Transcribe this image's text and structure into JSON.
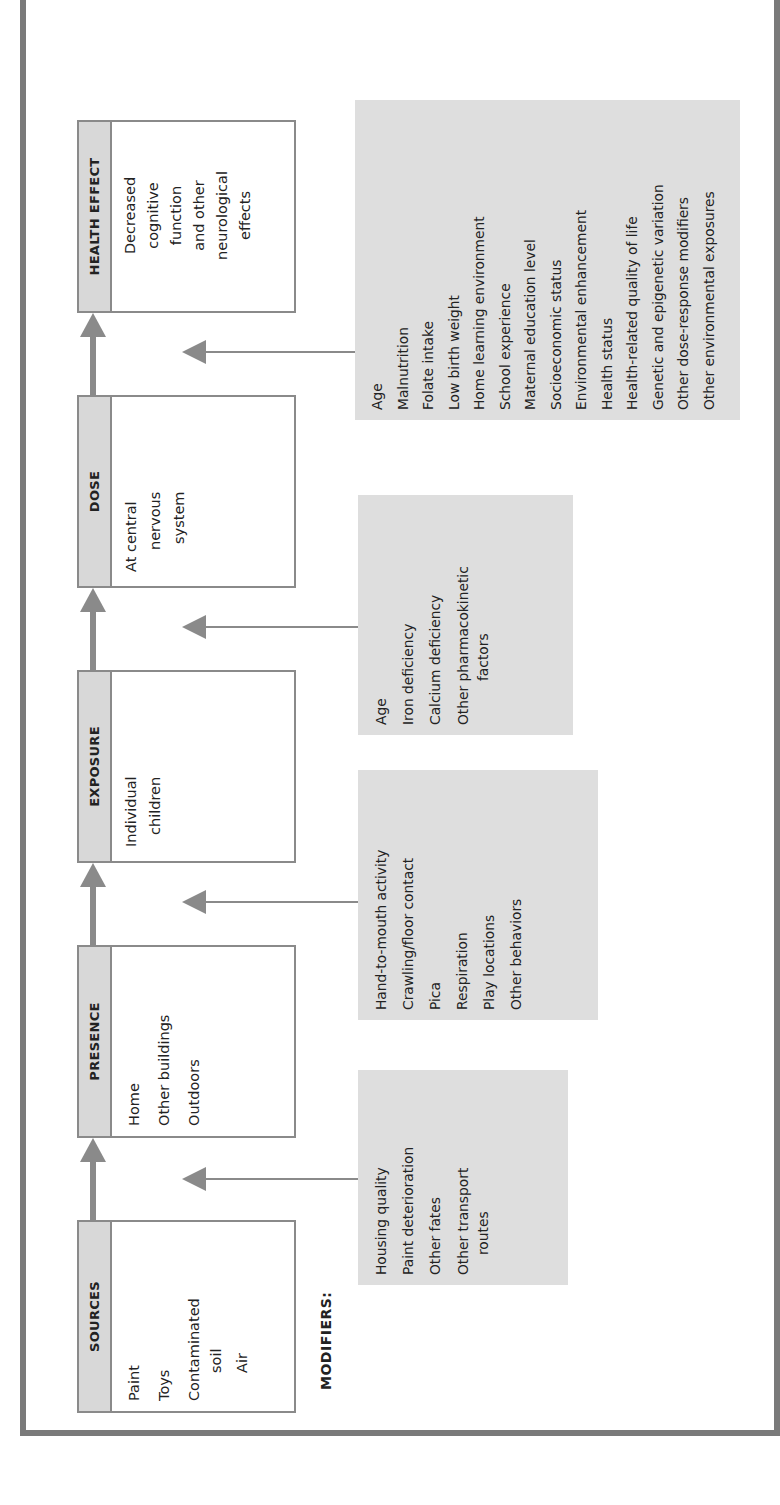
{
  "diagram": {
    "orientation": "rotated 90° counter-clockwise",
    "modifiers_label": "MODIFIERS:",
    "stages": [
      {
        "title": "SOURCES",
        "items": [
          "Paint",
          "Toys",
          "Contaminated",
          "soil",
          "Air"
        ]
      },
      {
        "title": "PRESENCE",
        "items": [
          "Home",
          "Other buildings",
          "Outdoors"
        ]
      },
      {
        "title": "EXPOSURE",
        "items": [
          "Individual",
          "children"
        ]
      },
      {
        "title": "DOSE",
        "items": [
          "At central",
          "nervous",
          "system"
        ]
      },
      {
        "title": "HEALTH EFFECT",
        "items": [
          "Decreased",
          "cognitive",
          "function",
          "and other",
          "neurological",
          "effects"
        ]
      }
    ],
    "modifiers": [
      {
        "items": [
          "Housing quality",
          "Paint deterioration",
          "Other fates",
          "Other transport",
          "routes"
        ]
      },
      {
        "items": [
          "Hand-to-mouth activity",
          "Crawling/floor contact",
          "Pica",
          "Respiration",
          "Play locations",
          "Other behaviors"
        ]
      },
      {
        "items": [
          "Age",
          "Iron deficiency",
          "Calcium deficiency",
          "Other pharmacokinetic",
          "factors"
        ]
      },
      {
        "items": [
          "Age",
          "Malnutrition",
          "Folate intake",
          "Low birth weight",
          "Home learning environment",
          "School experience",
          "Maternal education level",
          "Socioeconomic status",
          "Environmental enhancement",
          "Health status",
          "Health-related quality of life",
          "Genetic and epigenetic variation",
          "Other dose-response modifiers",
          "Other environmental exposures"
        ]
      }
    ],
    "colors": {
      "frame": "#7a7a7a",
      "box_border": "#8a8a8a",
      "header_fill": "#d8d8d8",
      "modifier_fill": "#dedede",
      "arrow": "#8a8a8a"
    }
  }
}
